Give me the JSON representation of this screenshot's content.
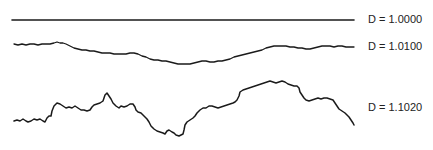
{
  "figure": {
    "curves": [
      {
        "id": "d-1-0000",
        "label": "D = 1.0000",
        "label_y": 13,
        "stroke_width": 1.6,
        "path": "M12,20 L354,20"
      },
      {
        "id": "d-1-0100",
        "label": "D = 1.0100",
        "label_y": 40,
        "stroke_width": 1.3,
        "path": "M14,44 L18,45 L22,44 L26,45 L30,44 L34,44 L38,45 L42,44 L46,44 L50,44 L54,43 L57,42 L60,43 L63,43 L66,44 L70,46 L74,48 L78,49 L82,50 L86,50 L90,51 L94,51 L98,52 L102,53 L106,53 L110,53 L114,54 L118,54 L122,54 L126,54 L130,53 L134,53 L138,54 L142,56 L146,57 L150,59 L154,60 L158,60 L162,61 L166,61 L170,62 L174,63 L178,64 L182,64 L186,64 L190,64 L194,63 L198,62 L202,61 L206,61 L210,62 L214,62 L218,61 L222,61 L226,60 L230,59 L234,57 L238,56 L242,55 L246,54 L250,53 L254,52 L258,51 L262,50 L266,48 L270,47 L274,46 L278,46 L282,46 L286,46 L290,47 L294,47 L298,48 L302,48 L306,49 L310,49 L314,48 L318,47 L322,46 L326,46 L330,46 L334,47 L338,46 L342,46 L346,47 L350,47 L354,47"
      },
      {
        "id": "d-1-1020",
        "label": "D = 1.1020",
        "label_y": 101,
        "stroke_width": 1.5,
        "path": "M14,121 L17,120 L20,121 L23,119 L26,121 L28,122 L31,121 L34,119 L37,120 L40,119 L43,121 L45,122 L47,118 L49,116 L51,116 L52,111 L54,106 L57,103 L60,104 L63,106 L66,108 L69,107 L72,108 L75,106 L78,108 L81,110 L84,110 L87,111 L90,110 L92,107 L94,105 L97,104 L100,103 L103,101 L105,95 L107,93 L109,96 L111,99 L113,103 L116,106 L119,108 L121,106 L124,107 L127,106 L130,104 L133,104 L135,107 L136,110 L138,112 L141,113 L144,116 L147,119 L149,122 L151,126 L154,129 L157,131 L160,132 L163,133 L165,134 L167,131 L169,130 L172,132 L174,133 L176,135 L179,136 L181,135 L183,134 L184,130 L185,125 L187,122 L190,120 L193,118 L195,116 L197,113 L200,110 L203,108 L206,108 L209,106 L212,106 L215,107 L218,108 L221,107 L224,106 L227,105 L230,104 L233,103 L235,102 L237,100 L239,96 L240,92 L243,90 L246,89 L249,88 L252,87 L255,86 L258,85 L261,84 L264,83 L267,82 L270,81 L273,82 L276,83 L279,82 L282,81 L285,82 L288,84 L291,85 L294,86 L297,86 L299,88 L300,92 L302,95 L304,98 L306,100 L309,101 L312,100 L315,99 L318,98 L321,99 L324,98 L327,98 L330,99 L333,100 L335,103 L337,106 L339,109 L342,111 L345,113 L347,115 L349,117 L351,120 L353,123 L354,125"
      }
    ]
  }
}
